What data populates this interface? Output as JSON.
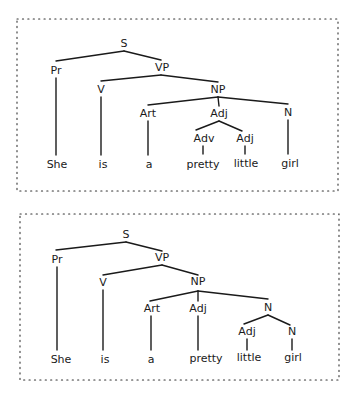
{
  "figure": {
    "ink_color": "#1a1a1a",
    "background": "#ffffff",
    "trees": [
      {
        "id": "tree-1",
        "frame": {
          "x": 17,
          "y": 19,
          "w": 321,
          "h": 172
        },
        "sentence": "She is a pretty little girl",
        "nodes": [
          {
            "id": "S",
            "label": "S",
            "x": 124,
            "y": 47
          },
          {
            "id": "Pr",
            "label": "Pr",
            "x": 56,
            "y": 74
          },
          {
            "id": "VP",
            "label": "VP",
            "x": 162,
            "y": 71
          },
          {
            "id": "V",
            "label": "V",
            "x": 101,
            "y": 93
          },
          {
            "id": "NP",
            "label": "NP",
            "x": 218,
            "y": 93
          },
          {
            "id": "Art",
            "label": "Art",
            "x": 148,
            "y": 117
          },
          {
            "id": "Adj1",
            "label": "Adj",
            "x": 219,
            "y": 117
          },
          {
            "id": "N",
            "label": "N",
            "x": 288,
            "y": 116
          },
          {
            "id": "Adv",
            "label": "Adv",
            "x": 204,
            "y": 142
          },
          {
            "id": "Adj2",
            "label": "Adj",
            "x": 245,
            "y": 142
          },
          {
            "id": "w1",
            "label": "She",
            "x": 57,
            "y": 168
          },
          {
            "id": "w2",
            "label": "is",
            "x": 103,
            "y": 168
          },
          {
            "id": "w3",
            "label": "a",
            "x": 149,
            "y": 168
          },
          {
            "id": "w4",
            "label": "pretty",
            "x": 203,
            "y": 168
          },
          {
            "id": "w5",
            "label": "little",
            "x": 246,
            "y": 167
          },
          {
            "id": "w6",
            "label": "girl",
            "x": 290,
            "y": 167
          }
        ],
        "edges": [
          [
            56,
            61,
            124,
            51
          ],
          [
            124,
            51,
            161,
            60
          ],
          [
            101,
            81,
            161,
            75
          ],
          [
            161,
            75,
            218,
            82
          ],
          [
            148,
            105,
            218,
            97
          ],
          [
            218,
            97,
            219,
            106
          ],
          [
            218,
            97,
            288,
            104
          ],
          [
            196,
            130,
            219,
            121
          ],
          [
            219,
            121,
            242,
            131
          ],
          [
            56,
            78,
            56,
            155
          ],
          [
            101,
            97,
            101,
            155
          ],
          [
            148,
            121,
            148,
            155
          ],
          [
            203,
            146,
            203,
            154
          ],
          [
            245,
            146,
            245,
            154
          ],
          [
            288,
            120,
            288,
            154
          ]
        ]
      },
      {
        "id": "tree-2",
        "frame": {
          "x": 20,
          "y": 214,
          "w": 319,
          "h": 166
        },
        "sentence": "She is a pretty little girl",
        "nodes": [
          {
            "id": "S",
            "label": "S",
            "x": 126,
            "y": 238
          },
          {
            "id": "Pr",
            "label": "Pr",
            "x": 57,
            "y": 263
          },
          {
            "id": "VP",
            "label": "VP",
            "x": 162,
            "y": 261
          },
          {
            "id": "V",
            "label": "V",
            "x": 103,
            "y": 286
          },
          {
            "id": "NP",
            "label": "NP",
            "x": 198,
            "y": 285
          },
          {
            "id": "Art",
            "label": "Art",
            "x": 152,
            "y": 312
          },
          {
            "id": "Adj1",
            "label": "Adj",
            "x": 198,
            "y": 312
          },
          {
            "id": "N1",
            "label": "N",
            "x": 268,
            "y": 311
          },
          {
            "id": "Adj2",
            "label": "Adj",
            "x": 247,
            "y": 335
          },
          {
            "id": "N2",
            "label": "N",
            "x": 292,
            "y": 335
          },
          {
            "id": "w1",
            "label": "She",
            "x": 61,
            "y": 363
          },
          {
            "id": "w2",
            "label": "is",
            "x": 105,
            "y": 363
          },
          {
            "id": "w3",
            "label": "a",
            "x": 151,
            "y": 363
          },
          {
            "id": "w4",
            "label": "pretty",
            "x": 206,
            "y": 362
          },
          {
            "id": "w5",
            "label": "little",
            "x": 249,
            "y": 361
          },
          {
            "id": "w6",
            "label": "girl",
            "x": 293,
            "y": 361
          }
        ],
        "edges": [
          [
            56,
            250,
            126,
            242
          ],
          [
            126,
            242,
            162,
            251
          ],
          [
            103,
            275,
            162,
            265
          ],
          [
            162,
            265,
            198,
            275
          ],
          [
            150,
            301,
            198,
            291
          ],
          [
            198,
            291,
            198,
            301
          ],
          [
            198,
            291,
            268,
            299
          ],
          [
            244,
            324,
            268,
            315
          ],
          [
            268,
            315,
            290,
            325
          ],
          [
            57,
            267,
            57,
            350
          ],
          [
            103,
            290,
            103,
            350
          ],
          [
            151,
            316,
            151,
            350
          ],
          [
            198,
            316,
            198,
            350
          ],
          [
            247,
            339,
            247,
            350
          ],
          [
            292,
            339,
            292,
            350
          ]
        ]
      }
    ]
  }
}
